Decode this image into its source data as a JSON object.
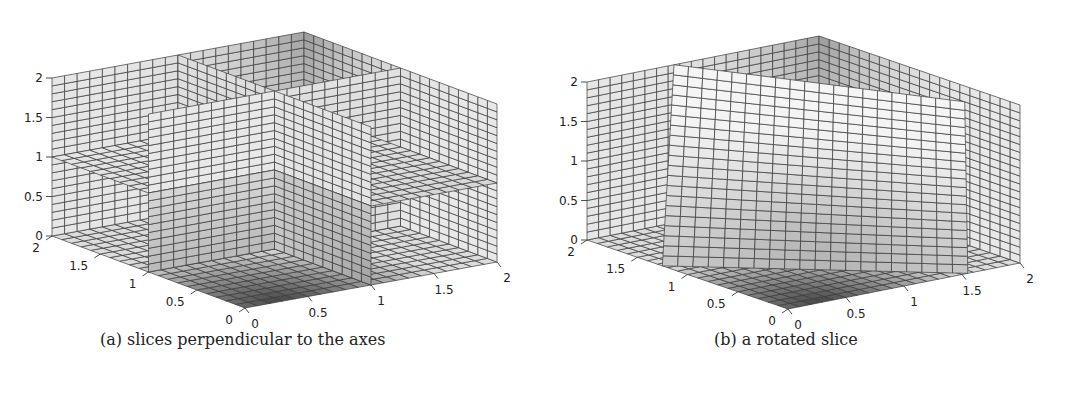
{
  "figure": {
    "panels": [
      {
        "id": "a",
        "caption": "(a) slices perpendicular to the axes",
        "caption_pos": {
          "x": 100,
          "y": 342
        },
        "projection": {
          "origin": [
            245,
            308
          ],
          "ex": [
            126,
            -23
          ],
          "ey": [
            -96.5,
            -36
          ],
          "ez": [
            0,
            -79
          ]
        },
        "grid_n": 20,
        "slice_type": "orthogonal",
        "slices": {
          "x": 1,
          "y": 1,
          "z": 1
        }
      },
      {
        "id": "b",
        "caption": "(b) a rotated slice",
        "caption_pos": {
          "x": 714,
          "y": 342
        },
        "projection": {
          "origin": [
            788,
            309
          ],
          "ex": [
            116,
            -23
          ],
          "ey": [
            -100.5,
            -34.5
          ],
          "ez": [
            0,
            -79
          ]
        },
        "grid_n": 20,
        "slice_type": "rotated",
        "slices": {
          "rotated_plane": "z = 1.5 - 0.75*x ... tilted plane through volume"
        }
      }
    ],
    "axis_ticks": {
      "z": [
        "0",
        "0.5",
        "1",
        "1.5",
        "2"
      ],
      "x": [
        "0",
        "0.5",
        "1",
        "1.5",
        "2"
      ],
      "y": [
        "0",
        "0.5",
        "1",
        "1.5",
        "2"
      ]
    },
    "bottom_partial_text": ""
  },
  "chart_data": [
    {
      "type": "other",
      "subtype": "3d-slice-plot",
      "title": "(a) slices perpendicular to the axes",
      "xlabel": "",
      "ylabel": "",
      "zlabel": "",
      "xlim": [
        0,
        2
      ],
      "ylim": [
        0,
        2
      ],
      "zlim": [
        0,
        2
      ],
      "xticks": [
        0,
        0.5,
        1,
        1.5,
        2
      ],
      "yticks": [
        0,
        0.5,
        1,
        1.5,
        2
      ],
      "zticks": [
        0,
        0.5,
        1,
        1.5,
        2
      ],
      "slices": [
        {
          "plane": "x",
          "value": 1
        },
        {
          "plane": "y",
          "value": 1
        },
        {
          "plane": "z",
          "value": 1
        }
      ],
      "walls": [
        "x=2 back",
        "y=2 back",
        "z=0 floor"
      ],
      "colormap": "grayscale",
      "grid": true
    },
    {
      "type": "other",
      "subtype": "3d-slice-plot",
      "title": "(b) a rotated slice",
      "xlim": [
        0,
        2
      ],
      "ylim": [
        0,
        2
      ],
      "zlim": [
        0,
        2
      ],
      "xticks": [
        0,
        0.5,
        1,
        1.5,
        2
      ],
      "yticks": [
        0,
        0.5,
        1,
        1.5,
        2
      ],
      "zticks": [
        0,
        0.5,
        1,
        1.5,
        2
      ],
      "slices": [
        {
          "plane": "rotated",
          "description": "tilted plane rising from floor near front-left to z≈1.5-2 at back"
        }
      ],
      "walls": [
        "x=2 back",
        "y=2 back",
        "z=0 floor"
      ],
      "colormap": "grayscale",
      "grid": true
    }
  ]
}
